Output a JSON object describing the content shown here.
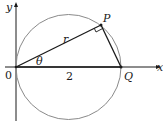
{
  "diagram": {
    "labels": {
      "y_axis": "y",
      "x_axis": "x",
      "origin": "0",
      "point_p": "P",
      "point_q": "Q",
      "radius": "r",
      "angle": "θ",
      "diameter_length": "2"
    },
    "colors": {
      "circle": "#8a8a8a",
      "lines": "#1a1a1a",
      "axes": "#1a1a1a"
    }
  }
}
